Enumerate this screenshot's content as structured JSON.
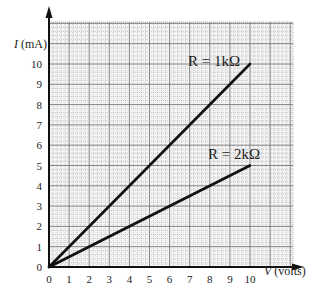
{
  "chart_data": {
    "type": "line",
    "title": "",
    "xlabel": "V (volts)",
    "ylabel": "I (mA)",
    "xlim": [
      0,
      10
    ],
    "ylim": [
      0,
      10
    ],
    "x_ticks": [
      "0",
      "1",
      "2",
      "3",
      "4",
      "5",
      "6",
      "7",
      "8",
      "9",
      "10"
    ],
    "y_ticks": [
      "0",
      "1",
      "2",
      "3",
      "4",
      "5",
      "6",
      "7",
      "8",
      "9",
      "10"
    ],
    "grid": true,
    "series": [
      {
        "name": "R = 1kΩ",
        "x": [
          0,
          10
        ],
        "values": [
          0,
          10
        ]
      },
      {
        "name": "R = 2kΩ",
        "x": [
          0,
          10
        ],
        "values": [
          0,
          5
        ]
      }
    ],
    "annotations": [
      "R = 1kΩ",
      "R = 2kΩ"
    ]
  },
  "axis": {
    "x_label_var": "V",
    "x_label_unit": " (volts)",
    "y_label_var": "I",
    "y_label_unit": " (mA)"
  },
  "labels": {
    "r1": "R = 1kΩ",
    "r2": "R = 2kΩ"
  }
}
